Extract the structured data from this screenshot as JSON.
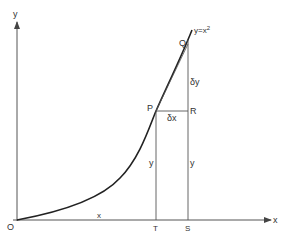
{
  "diagram": {
    "type": "calculus-derivative-figure",
    "colors": {
      "line": "#555555",
      "curve": "#222222",
      "text": "#333333",
      "background": "#ffffff"
    },
    "axes": {
      "x_label": "x",
      "y_label": "y",
      "origin_label": "O"
    },
    "curve": {
      "label": "y=x",
      "exponent": "2"
    },
    "points": {
      "P": "P",
      "Q": "Q",
      "R": "R",
      "T": "T",
      "S": "S"
    },
    "labels": {
      "delta_x": "δx",
      "delta_y": "δy",
      "y_at_T": "y",
      "y_at_S": "y",
      "x_segment": "x"
    }
  }
}
